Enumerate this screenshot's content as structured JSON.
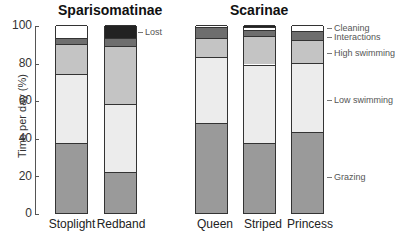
{
  "chart_data": {
    "type": "bar",
    "stacked": true,
    "groups": [
      {
        "title": "Sparisomatinae",
        "categories": [
          "Stoplight",
          "Redband"
        ]
      },
      {
        "title": "Scarinae",
        "categories": [
          "Queen",
          "Striped",
          "Princess"
        ]
      }
    ],
    "categories": [
      "Stoplight",
      "Redband",
      "Queen",
      "Striped",
      "Princess"
    ],
    "series": [
      {
        "name": "Grazing",
        "values": [
          37,
          22,
          48,
          37,
          43
        ],
        "color": "#9a9a9a"
      },
      {
        "name": "Low swimming",
        "values": [
          37,
          36,
          35,
          42,
          37
        ],
        "color": "#ececec"
      },
      {
        "name": "High swimming",
        "values": [
          16,
          31,
          10,
          15,
          12
        ],
        "color": "#c4c4c4"
      },
      {
        "name": "Interactions",
        "values": [
          3,
          4,
          6,
          3.5,
          5
        ],
        "color": "#6e6e6e"
      },
      {
        "name": "Cleaning",
        "values": [
          7,
          0,
          1,
          1.5,
          3
        ],
        "color": "#ffffff"
      },
      {
        "name": "Lost",
        "values": [
          0,
          7,
          0,
          1,
          0
        ],
        "color": "#222222"
      }
    ],
    "ylabel": "Time per day (%)",
    "yticks": [
      0,
      20,
      40,
      60,
      80,
      100
    ],
    "ylim": [
      0,
      100
    ],
    "grid": false
  },
  "titles": {
    "left": "Sparisomatinae",
    "right": "Scarinae"
  },
  "ylabel": "Time per day (%)",
  "ticks": [
    "0",
    "20",
    "40",
    "60",
    "80",
    "100"
  ],
  "cats": [
    "Stoplight",
    "Redband",
    "Queen",
    "Striped",
    "Princess"
  ],
  "legend": {
    "lost": "Lost",
    "cleaning": "Cleaning",
    "interactions": "Interactions",
    "high": "High swimming",
    "low": "Low swimming",
    "grazing": "Grazing"
  }
}
